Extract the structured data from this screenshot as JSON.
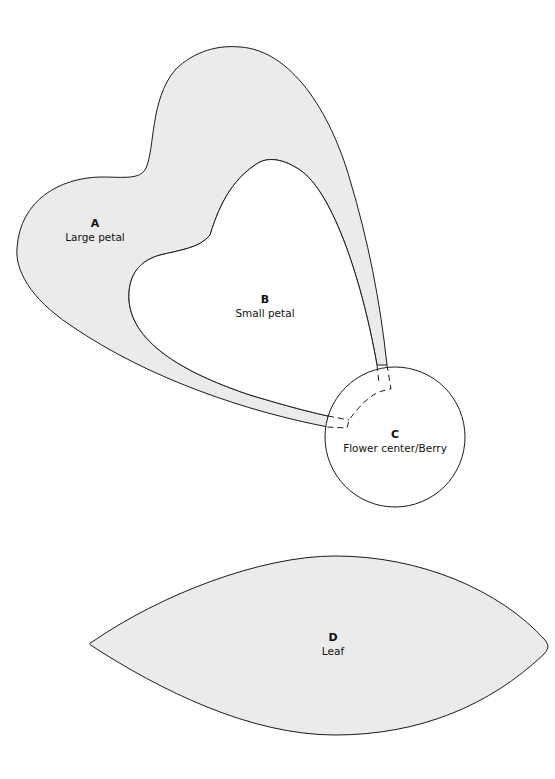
{
  "colors": {
    "fill": "#ebebeb",
    "stroke": "#1a1a1a",
    "background": "#ffffff"
  },
  "pieces": [
    {
      "id": "A",
      "letter": "A",
      "name": "Large petal"
    },
    {
      "id": "B",
      "letter": "B",
      "name": "Small petal"
    },
    {
      "id": "C",
      "letter": "C",
      "name": "Flower center/Berry"
    },
    {
      "id": "D",
      "letter": "D",
      "name": "Leaf"
    }
  ]
}
